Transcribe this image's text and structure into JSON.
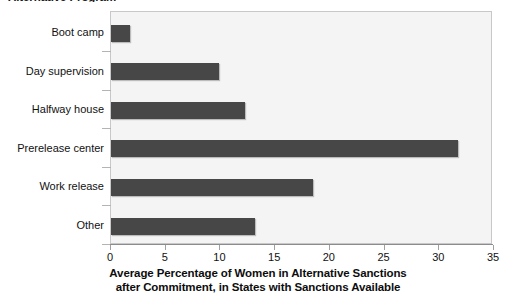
{
  "chart_data": {
    "type": "bar",
    "orientation": "horizontal",
    "title": "Alternative Program",
    "subtitle": "",
    "categories": [
      "Boot camp",
      "Day supervision",
      "Halfway house",
      "Prerelease center",
      "Work release",
      "Other"
    ],
    "values": [
      1.7,
      9.9,
      12.2,
      31.7,
      18.5,
      13.2
    ],
    "xlabel_line1": "Average Percentage of Women in Alternative Sanctions",
    "xlabel_line2": "after Commitment, in States with Sanctions Available",
    "ylabel": "",
    "xlim": [
      0,
      35
    ],
    "xticks": [
      0,
      5,
      10,
      15,
      20,
      25,
      30,
      35
    ],
    "xtick_labels": [
      "0",
      "5",
      "10",
      "15",
      "20",
      "25",
      "30",
      "35"
    ],
    "grid": false,
    "legend": null,
    "bar_color": "#474747",
    "plot_background": "#f4f4f4",
    "frame_color": "#c8c8c8"
  }
}
